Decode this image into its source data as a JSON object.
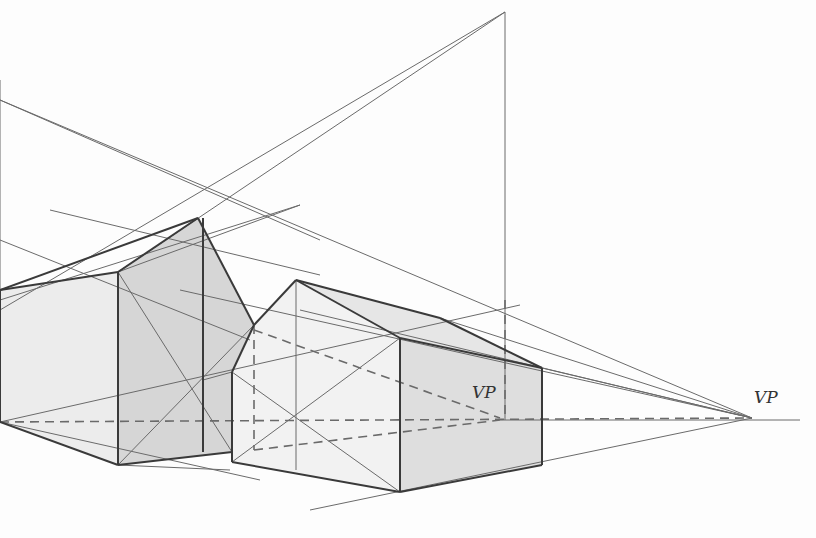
{
  "diagram": {
    "title": "",
    "type": "two-point perspective construction",
    "colors": {
      "background": "#fdfdfd",
      "shade_light": "#ececec",
      "shade_dark": "#d6d6d6",
      "line_thin": "#6a6a6a",
      "line_thick": "#3a3a3a"
    },
    "labels": [
      {
        "text": "VP",
        "x": 472,
        "y": 390
      },
      {
        "text": "VP",
        "x": 754,
        "y": 395
      }
    ],
    "shaded_polygons": [
      {
        "name": "left-box-front-face",
        "fill": "#ececec",
        "points": "0,290 118,272 118,465 0,422"
      },
      {
        "name": "left-box-side-face",
        "fill": "#d6d6d6",
        "points": "118,272 198,218 254,325 232,372 232,452 118,465"
      },
      {
        "name": "right-box-front-face",
        "fill": "#f2f2f2",
        "points": "232,372 254,325 296,280 400,338 400,492 232,462"
      },
      {
        "name": "right-box-side-face",
        "fill": "#dedede",
        "points": "400,338 542,368 542,465 400,492"
      },
      {
        "name": "right-roof-face",
        "fill": "#e6e6e6",
        "points": "296,280 400,338 542,368 440,318"
      }
    ],
    "thick_lines": [
      [
        0,
        290,
        118,
        272
      ],
      [
        118,
        272,
        198,
        218
      ],
      [
        198,
        218,
        254,
        325
      ],
      [
        254,
        325,
        232,
        372
      ],
      [
        118,
        272,
        118,
        465
      ],
      [
        0,
        422,
        118,
        465
      ],
      [
        118,
        465,
        232,
        452
      ],
      [
        203,
        218,
        203,
        452
      ],
      [
        232,
        372,
        232,
        462
      ],
      [
        232,
        462,
        400,
        492
      ],
      [
        296,
        280,
        400,
        338
      ],
      [
        296,
        280,
        254,
        325
      ],
      [
        400,
        338,
        400,
        492
      ],
      [
        400,
        338,
        542,
        368
      ],
      [
        296,
        280,
        440,
        318
      ],
      [
        440,
        318,
        542,
        368
      ],
      [
        542,
        368,
        542,
        465
      ],
      [
        400,
        492,
        542,
        465
      ],
      [
        0,
        290,
        0,
        422
      ],
      [
        0,
        290,
        198,
        218
      ]
    ],
    "thin_lines": [
      [
        0,
        100,
        320,
        240
      ],
      [
        0,
        100,
        752,
        418
      ],
      [
        505,
        12,
        0,
        310
      ],
      [
        505,
        12,
        118,
        272
      ],
      [
        505,
        12,
        505,
        420
      ],
      [
        0,
        80,
        0,
        422
      ],
      [
        50,
        210,
        320,
        275
      ],
      [
        0,
        240,
        250,
        340
      ],
      [
        0,
        300,
        300,
        205
      ],
      [
        118,
        272,
        300,
        205
      ],
      [
        180,
        290,
        752,
        418
      ],
      [
        300,
        310,
        752,
        418
      ],
      [
        0,
        422,
        520,
        305
      ],
      [
        118,
        465,
        254,
        325
      ],
      [
        118,
        272,
        232,
        452
      ],
      [
        203,
        380,
        232,
        372
      ],
      [
        232,
        372,
        400,
        492
      ],
      [
        232,
        462,
        400,
        338
      ],
      [
        296,
        280,
        296,
        470
      ],
      [
        310,
        510,
        752,
        418
      ],
      [
        0,
        422,
        260,
        480
      ],
      [
        118,
        465,
        230,
        470
      ],
      [
        542,
        368,
        752,
        418
      ],
      [
        440,
        318,
        752,
        418
      ],
      [
        500,
        420,
        800,
        420
      ]
    ],
    "dashed_lines": [
      [
        0,
        422,
        752,
        418
      ],
      [
        254,
        325,
        254,
        450
      ],
      [
        254,
        330,
        500,
        418
      ],
      [
        254,
        450,
        500,
        420
      ],
      [
        505,
        300,
        505,
        418
      ]
    ]
  }
}
